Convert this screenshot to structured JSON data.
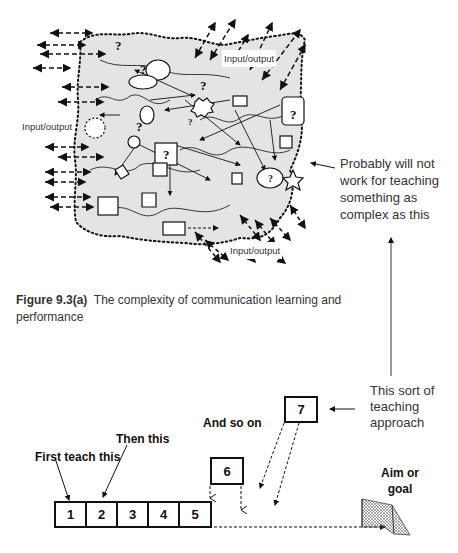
{
  "figure": {
    "io_labels": [
      "Input/output",
      "Input/output",
      "Input/output"
    ],
    "note": "Probably will not work for teaching something as complex as this",
    "note_lines": [
      "Probably will not",
      "work for teaching",
      "something as",
      "complex as this"
    ],
    "caption_label": "Figure 9.3(a)",
    "caption_text": "The complexity of communication learning and performance"
  },
  "sequence": {
    "first_label": "First teach this",
    "then_label": "Then this",
    "andso_label": "And so on",
    "approach_lines": [
      "This sort of",
      "teaching",
      "approach"
    ],
    "goal_lines": [
      "Aim or",
      "goal"
    ],
    "steps": [
      "1",
      "2",
      "3",
      "4",
      "5",
      "6",
      "7"
    ]
  }
}
